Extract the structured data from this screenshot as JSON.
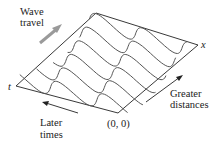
{
  "diagram": {
    "labels": {
      "wave_travel_line1": "Wave",
      "wave_travel_line2": "travel",
      "later_times_line1": "Later",
      "later_times_line2": "times",
      "greater_distances_line1": "Greater",
      "greater_distances_line2": "distances",
      "origin": "(0, 0)",
      "x_axis": "x",
      "t_axis": "t"
    },
    "colors": {
      "wave_stroke": "#555555",
      "axis_stroke": "#222222",
      "wave_travel_arrow": "#9a9a9a",
      "text": "#222222"
    },
    "frame": {
      "top_left": [
        96,
        13
      ],
      "top_right": [
        198,
        45
      ],
      "bottom_left": [
        16,
        86
      ],
      "origin": [
        118,
        113
      ]
    },
    "wave_count": 6
  }
}
